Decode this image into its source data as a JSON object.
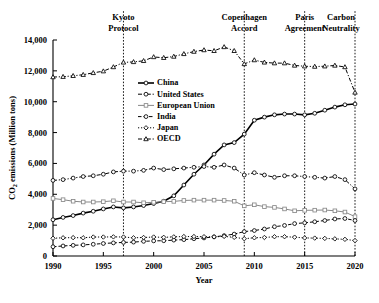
{
  "chart_data": {
    "type": "line",
    "title": "",
    "xlabel": "Year",
    "ylabel": "CO2 emissions (Million tons)",
    "ylabel_display": "CO₂ emissions (Million tons)",
    "xlim": [
      1990,
      2020
    ],
    "ylim": [
      0,
      14000
    ],
    "grid": false,
    "legend_position": "upper-center-left",
    "xticks": [
      "1990",
      "1995",
      "2000",
      "2005",
      "2010",
      "2015",
      "2020"
    ],
    "xtick_values": [
      1990,
      1995,
      2000,
      2005,
      2010,
      2015,
      2020
    ],
    "yticks": [
      "0",
      "2,000",
      "4,000",
      "6,000",
      "8,000",
      "10,000",
      "12,000",
      "14,000"
    ],
    "ytick_values": [
      0,
      2000,
      4000,
      6000,
      8000,
      10000,
      12000,
      14000
    ],
    "x": [
      1990,
      1991,
      1992,
      1993,
      1994,
      1995,
      1996,
      1997,
      1998,
      1999,
      2000,
      2001,
      2002,
      2003,
      2004,
      2005,
      2006,
      2007,
      2008,
      2009,
      2010,
      2011,
      2012,
      2013,
      2014,
      2015,
      2016,
      2017,
      2018,
      2019,
      2020
    ],
    "series": [
      {
        "name": "China",
        "marker": "circle-open",
        "line": "solid",
        "values": [
          2350,
          2500,
          2620,
          2780,
          2900,
          3050,
          3180,
          3120,
          3180,
          3270,
          3400,
          3550,
          3900,
          4600,
          5300,
          5900,
          6600,
          7200,
          7350,
          7900,
          8800,
          9000,
          9150,
          9200,
          9200,
          9150,
          9250,
          9450,
          9650,
          9800,
          9850
        ]
      },
      {
        "name": "United States",
        "marker": "circle-open",
        "line": "dash-dot",
        "values": [
          4900,
          4950,
          5050,
          5150,
          5200,
          5300,
          5450,
          5500,
          5500,
          5550,
          5700,
          5600,
          5650,
          5700,
          5750,
          5800,
          5750,
          5900,
          5700,
          5250,
          5400,
          5250,
          5100,
          5200,
          5200,
          5150,
          5100,
          5050,
          5150,
          4950,
          4350
        ]
      },
      {
        "name": "European Union",
        "marker": "square-open",
        "line": "solid-light",
        "values": [
          3730,
          3650,
          3550,
          3500,
          3500,
          3520,
          3580,
          3500,
          3500,
          3450,
          3480,
          3520,
          3540,
          3600,
          3620,
          3620,
          3620,
          3600,
          3550,
          3250,
          3320,
          3200,
          3150,
          3050,
          2930,
          2960,
          2970,
          2980,
          2930,
          2850,
          2550
        ]
      },
      {
        "name": "India",
        "marker": "circle-open",
        "line": "dashed",
        "values": [
          600,
          650,
          690,
          720,
          760,
          810,
          850,
          880,
          900,
          950,
          980,
          990,
          1030,
          1060,
          1120,
          1170,
          1240,
          1320,
          1420,
          1580,
          1650,
          1750,
          1900,
          1980,
          2100,
          2150,
          2220,
          2300,
          2400,
          2430,
          2300
        ]
      },
      {
        "name": "Japan",
        "marker": "diamond-open",
        "line": "dotted",
        "values": [
          1150,
          1180,
          1190,
          1180,
          1230,
          1230,
          1240,
          1230,
          1180,
          1200,
          1230,
          1210,
          1240,
          1260,
          1260,
          1250,
          1240,
          1270,
          1210,
          1120,
          1180,
          1200,
          1250,
          1250,
          1220,
          1170,
          1160,
          1140,
          1110,
          1080,
          1000
        ]
      },
      {
        "name": "OECD",
        "marker": "triangle-open",
        "line": "dash-dot",
        "values": [
          11600,
          11620,
          11680,
          11750,
          11870,
          11980,
          12250,
          12550,
          12580,
          12650,
          12900,
          12850,
          12930,
          13100,
          13250,
          13350,
          13300,
          13550,
          13300,
          12450,
          12700,
          12550,
          12500,
          12500,
          12350,
          12300,
          12280,
          12300,
          12350,
          12250,
          10600
        ]
      }
    ],
    "annotations": [
      {
        "label_line1": "Kyoto",
        "label_line2": "Protocol",
        "x": 1997
      },
      {
        "label_line1": "Copenhagen",
        "label_line2": "Accord",
        "x": 2009
      },
      {
        "label_line1": "Paris",
        "label_line2": "Agreement",
        "x": 2015
      },
      {
        "label_line1": "Carbon",
        "label_line2": "Neutrality",
        "x": 2020
      }
    ]
  },
  "colors": {
    "axis": "#000000",
    "series_china": "#000000",
    "series_us": "#000000",
    "series_eu": "#888888",
    "series_india": "#000000",
    "series_japan": "#000000",
    "series_oecd": "#000000",
    "background": "#ffffff"
  }
}
